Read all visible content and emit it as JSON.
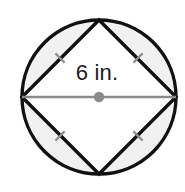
{
  "figure": {
    "canvas": {
      "width": 185,
      "height": 192,
      "background": "#ffffff"
    },
    "label": {
      "text": "6 in.",
      "value": 6,
      "unit": "in.",
      "color": "#1a1a1a",
      "x": 97,
      "y": 80,
      "font_size": 22
    },
    "circle": {
      "name": "outer-circle",
      "cx": 99,
      "cy": 97,
      "r": 77,
      "stroke": "#111111",
      "stroke_width": 3.4,
      "fill": "#ffffff"
    },
    "segments": {
      "name": "shaded-segments",
      "fill": "#f1f1f1",
      "count": 4,
      "description": "four circular segments between circle and inscribed square"
    },
    "square": {
      "name": "inscribed-square",
      "stroke": "#111111",
      "stroke_width": 3.4,
      "fill": "#ffffff",
      "rotation_deg": 45,
      "vertices": [
        {
          "name": "top-vertex",
          "x": 99,
          "y": 20
        },
        {
          "name": "right-vertex",
          "x": 176,
          "y": 97
        },
        {
          "name": "bottom-vertex",
          "x": 99,
          "y": 174
        },
        {
          "name": "left-vertex",
          "x": 22,
          "y": 97
        }
      ]
    },
    "diameter": {
      "name": "diameter-line",
      "x1": 22,
      "y1": 97,
      "x2": 176,
      "y2": 97,
      "stroke": "#8a8a8a",
      "stroke_width": 2.6
    },
    "center_dot": {
      "name": "center-point",
      "cx": 99,
      "cy": 97,
      "r": 5.2,
      "fill": "#8a8a8a"
    },
    "tick_marks": {
      "color": "#8f8f8f",
      "stroke_width": 2.2,
      "length": 13,
      "items": [
        {
          "name": "tick-top-left",
          "cx": 60,
          "cy": 58,
          "angle": 45
        },
        {
          "name": "tick-top-right",
          "cx": 138,
          "cy": 58,
          "angle": -45
        },
        {
          "name": "tick-bottom-left",
          "cx": 60,
          "cy": 136,
          "angle": -45
        },
        {
          "name": "tick-bottom-right",
          "cx": 138,
          "cy": 136,
          "angle": 45
        }
      ]
    }
  }
}
